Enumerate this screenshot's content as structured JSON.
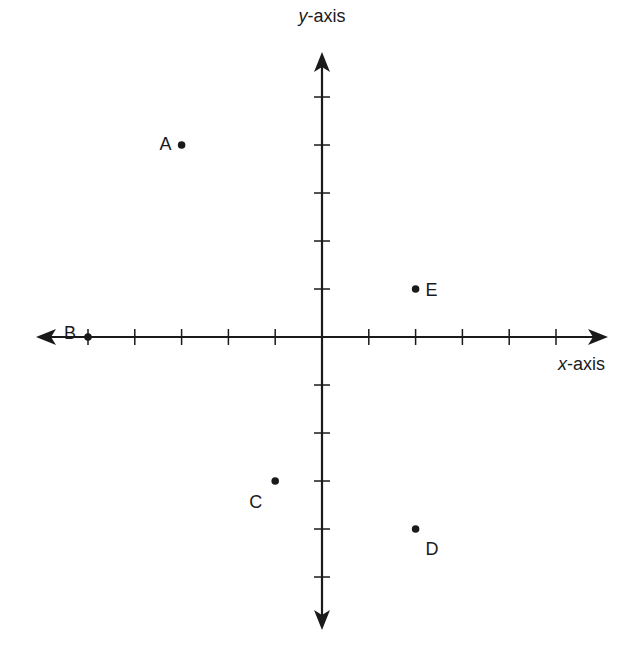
{
  "chart_data": {
    "type": "scatter",
    "title": "",
    "xlabel": "x-axis",
    "ylabel": "y-axis",
    "xlim": [
      -5,
      5
    ],
    "ylim": [
      -5,
      5
    ],
    "grid": false,
    "tick_labels": false,
    "points": [
      {
        "label": "A",
        "x": -3,
        "y": 4
      },
      {
        "label": "B",
        "x": -5,
        "y": 0
      },
      {
        "label": "C",
        "x": -1,
        "y": -3
      },
      {
        "label": "D",
        "x": 2,
        "y": -4
      },
      {
        "label": "E",
        "x": 2,
        "y": 1
      }
    ]
  },
  "axes": {
    "x_label_prefix": "x",
    "x_label_suffix": "-axis",
    "y_label_prefix": "y",
    "y_label_suffix": "-axis"
  },
  "colors": {
    "ink": "#1a1a1a",
    "background": "#ffffff"
  }
}
